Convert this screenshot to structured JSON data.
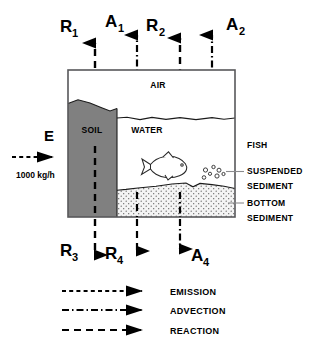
{
  "diagram": {
    "compartments": [
      {
        "id": "air",
        "label": "AIR"
      },
      {
        "id": "soil",
        "label": "SOIL"
      },
      {
        "id": "water",
        "label": "WATER"
      }
    ],
    "side_labels": [
      {
        "id": "fish",
        "line1": "FISH",
        "line2": ""
      },
      {
        "id": "suspended",
        "line1": "SUSPENDED",
        "line2": "SEDIMENT"
      },
      {
        "id": "bottom",
        "line1": "BOTTOM",
        "line2": "SEDIMENT"
      }
    ],
    "emission": {
      "label": "E",
      "rate": "1000 kg/h",
      "type": "emission"
    },
    "fluxes_top": [
      {
        "id": "r1",
        "base": "R",
        "sub": "1",
        "type": "reaction",
        "direction": "up"
      },
      {
        "id": "a1",
        "base": "A",
        "sub": "1",
        "type": "advection",
        "direction": "up"
      },
      {
        "id": "r2",
        "base": "R",
        "sub": "2",
        "type": "reaction",
        "direction": "up"
      },
      {
        "id": "a2",
        "base": "A",
        "sub": "2",
        "type": "advection",
        "direction": "up"
      }
    ],
    "fluxes_bottom": [
      {
        "id": "r3",
        "base": "R",
        "sub": "3",
        "type": "reaction",
        "direction": "down"
      },
      {
        "id": "r4",
        "base": "R",
        "sub": "4",
        "type": "reaction",
        "direction": "down"
      },
      {
        "id": "a4",
        "base": "A",
        "sub": "4",
        "type": "advection",
        "direction": "down"
      }
    ],
    "legend": [
      {
        "id": "emission",
        "label": "EMISSION",
        "style": "emission"
      },
      {
        "id": "advection",
        "label": "ADVECTION",
        "style": "advection"
      },
      {
        "id": "reaction",
        "label": "REACTION",
        "style": "reaction"
      }
    ],
    "colors": {
      "soil_fill": "#808080",
      "sediment_fill": "#efefef",
      "frame_stroke": "#58585a",
      "ink": "#000000",
      "background": "#ffffff",
      "leader": "#8a8a8c"
    }
  }
}
